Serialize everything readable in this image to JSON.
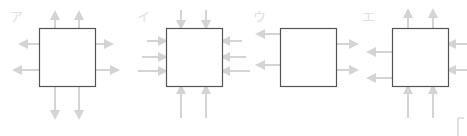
{
  "options": [
    {
      "label": "ア",
      "label_x": 10,
      "label_y": 10,
      "box": {
        "x": 39,
        "y": 28,
        "w": 56,
        "h": 58
      },
      "arrows": [
        {
          "dir": "up",
          "x": 55,
          "from": 28,
          "to": 12
        },
        {
          "dir": "up",
          "x": 79,
          "from": 28,
          "to": 12
        },
        {
          "dir": "left",
          "y": 44,
          "from": 39,
          "to": 20
        },
        {
          "dir": "left",
          "y": 70,
          "from": 39,
          "to": 14
        },
        {
          "dir": "right",
          "y": 44,
          "from": 95,
          "to": 112
        },
        {
          "dir": "right",
          "y": 70,
          "from": 95,
          "to": 118
        },
        {
          "dir": "down",
          "x": 55,
          "from": 86,
          "to": 118
        },
        {
          "dir": "down",
          "x": 79,
          "from": 86,
          "to": 118
        }
      ]
    },
    {
      "label": "イ",
      "label_x": 137,
      "label_y": 10,
      "box": {
        "x": 166,
        "y": 28,
        "w": 56,
        "h": 58
      },
      "arrows": [
        {
          "dir": "down",
          "x": 181,
          "from": 10,
          "to": 28
        },
        {
          "dir": "down",
          "x": 206,
          "from": 10,
          "to": 28
        },
        {
          "dir": "right",
          "y": 41,
          "from": 147,
          "to": 166
        },
        {
          "dir": "right",
          "y": 57,
          "from": 142,
          "to": 166
        },
        {
          "dir": "right",
          "y": 71,
          "from": 138,
          "to": 166
        },
        {
          "dir": "left",
          "y": 41,
          "from": 242,
          "to": 222
        },
        {
          "dir": "left",
          "y": 57,
          "from": 246,
          "to": 222
        },
        {
          "dir": "left",
          "y": 71,
          "from": 250,
          "to": 222
        },
        {
          "dir": "up",
          "x": 181,
          "from": 118,
          "to": 86
        },
        {
          "dir": "up",
          "x": 206,
          "from": 118,
          "to": 86
        }
      ]
    },
    {
      "label": "ウ",
      "label_x": 253,
      "label_y": 10,
      "box": {
        "x": 280,
        "y": 28,
        "w": 56,
        "h": 58
      },
      "arrows": [
        {
          "dir": "left",
          "y": 34,
          "from": 280,
          "to": 257
        },
        {
          "dir": "left",
          "y": 65,
          "from": 280,
          "to": 257
        },
        {
          "dir": "right",
          "y": 44,
          "from": 336,
          "to": 357
        },
        {
          "dir": "right",
          "y": 70,
          "from": 336,
          "to": 357
        }
      ]
    },
    {
      "label": "エ",
      "label_x": 362,
      "label_y": 10,
      "box": {
        "x": 392,
        "y": 28,
        "w": 56,
        "h": 58
      },
      "arrows": [
        {
          "dir": "up",
          "x": 408,
          "from": 28,
          "to": 10
        },
        {
          "dir": "up",
          "x": 433,
          "from": 28,
          "to": 10
        },
        {
          "dir": "left",
          "y": 52,
          "from": 392,
          "to": 368
        },
        {
          "dir": "left",
          "y": 78,
          "from": 392,
          "to": 368
        },
        {
          "dir": "left",
          "y": 44,
          "from": 467,
          "to": 448
        },
        {
          "dir": "left",
          "y": 70,
          "from": 467,
          "to": 448
        },
        {
          "dir": "up",
          "x": 408,
          "from": 118,
          "to": 86
        },
        {
          "dir": "up",
          "x": 433,
          "from": 118,
          "to": 86
        }
      ]
    }
  ],
  "colors": {
    "box_stroke": "#555555",
    "arrow": "#d4d4d4",
    "label": "#dddddd"
  }
}
